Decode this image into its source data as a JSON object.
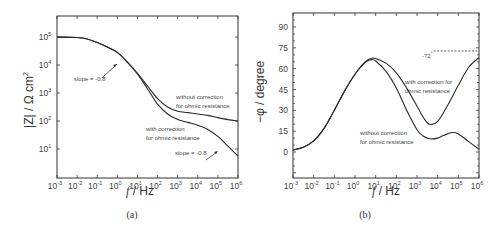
{
  "chart_data": [
    {
      "type": "line",
      "panel": "(a)",
      "title": "",
      "xlabel": "f / Hz",
      "ylabel": "|Z| / Ω cm²",
      "xscale": "log",
      "yscale": "log",
      "xlim": [
        0.001,
        1000000
      ],
      "ylim": [
        1,
        562341
      ],
      "x_ticks": [
        "10^-3",
        "10^-2",
        "10^-1",
        "10^0",
        "10^1",
        "10^2",
        "10^3",
        "10^4",
        "10^5",
        "10^6"
      ],
      "y_ticks": [
        "10^1",
        "10^2",
        "10^3",
        "10^4",
        "10^5"
      ],
      "grid": false,
      "series": [
        {
          "name": "without correction for ohmic resistance",
          "log_x": [
            -3,
            -2,
            -1.5,
            -1,
            -0.5,
            0,
            0.5,
            1,
            1.5,
            2,
            2.5,
            3,
            3.5,
            4,
            4.5,
            5,
            5.5,
            6
          ],
          "log_y": [
            5.0,
            4.98,
            4.93,
            4.8,
            4.64,
            4.45,
            4.1,
            3.7,
            3.25,
            2.8,
            2.5,
            2.35,
            2.3,
            2.25,
            2.2,
            2.12,
            2.05,
            2.0
          ]
        },
        {
          "name": "with correction for ohmic resistance",
          "log_x": [
            -3,
            -2,
            -1.5,
            -1,
            -0.5,
            0,
            0.5,
            1,
            1.5,
            2,
            2.5,
            3,
            3.5,
            4,
            4.5,
            5,
            5.5,
            6
          ],
          "log_y": [
            5.0,
            4.98,
            4.93,
            4.8,
            4.64,
            4.45,
            4.1,
            3.68,
            3.15,
            2.6,
            2.25,
            2.05,
            1.95,
            1.85,
            1.7,
            1.45,
            1.1,
            0.75
          ]
        }
      ],
      "annotations": [
        {
          "text": "slope = -0.8",
          "at_log_x": 0.3,
          "at_log_y": 4.3
        },
        {
          "text": "without correction",
          "line2": "for ohmic resistance"
        },
        {
          "text": "with correction",
          "line2": "for ohmic resistance"
        },
        {
          "text": "slope = -0.8",
          "at_log_x": 5.0,
          "at_log_y": 1.45
        }
      ]
    },
    {
      "type": "line",
      "panel": "(b)",
      "title": "",
      "xlabel": "f / Hz",
      "ylabel": "−φ / degree",
      "xscale": "log",
      "yscale": "linear",
      "xlim": [
        0.001,
        1000000
      ],
      "ylim": [
        -18,
        100
      ],
      "x_ticks": [
        "10^-3",
        "10^-2",
        "10^-1",
        "10^0",
        "10^1",
        "10^2",
        "10^3",
        "10^4",
        "10^5",
        "10^6"
      ],
      "y_ticks": [
        0,
        15,
        30,
        45,
        60,
        75,
        90
      ],
      "grid": false,
      "series": [
        {
          "name": "with correction for ohmic resistance",
          "log_x": [
            -3,
            -2.5,
            -2,
            -1.5,
            -1,
            -0.5,
            0,
            0.5,
            0.8,
            1,
            1.5,
            2,
            2.5,
            3,
            3.3,
            3.6,
            4,
            4.5,
            5,
            5.5,
            6
          ],
          "log_y_values_deg": [
            1.5,
            3.5,
            8,
            17,
            30,
            44,
            56,
            65,
            67.5,
            67.3,
            64,
            57,
            46,
            33,
            25,
            20,
            22,
            34,
            48,
            61,
            68
          ]
        },
        {
          "name": "without correction for ohmic resistance",
          "log_x": [
            -3,
            -2.5,
            -2,
            -1.5,
            -1,
            -0.5,
            0,
            0.5,
            0.8,
            1,
            1.5,
            2,
            2.5,
            3,
            3.3,
            3.6,
            4,
            4.3,
            4.7,
            5,
            5.5,
            6
          ],
          "log_y_values_deg": [
            1.5,
            3.5,
            8,
            17,
            30,
            44,
            56,
            64.5,
            66.5,
            65.5,
            58,
            46,
            30,
            16,
            11.5,
            9.5,
            10,
            12,
            14,
            13,
            7.5,
            2
          ]
        }
      ],
      "reference_line": {
        "value_deg": 72,
        "from_log_x": 3.8,
        "to_log_x": 6,
        "style": "dashed"
      },
      "annotations": [
        {
          "text": "-72°"
        },
        {
          "text": "with correction for",
          "line2": "ohmic resistance"
        },
        {
          "text": "without correction",
          "line2": "for ohmic resistance"
        }
      ]
    }
  ],
  "panels": {
    "a": {
      "caption": "(a)",
      "xlabel_italic": "f",
      "xlabel_rest": " / Hz",
      "ylabel": "|Z| / Ω cm",
      "ylabel_sup": "2",
      "annot_slope_1": "slope = -0.8",
      "annot_slope_2": "slope = -0.8",
      "annot_without_1": "without correction",
      "annot_without_2": "for ohmic resistance",
      "annot_with_1": "with correction",
      "annot_with_2": "for ohmic resistance"
    },
    "b": {
      "caption": "(b)",
      "xlabel_italic": "f",
      "xlabel_rest": " / Hz",
      "ylabel": "−φ / degree",
      "annot_72": "-72",
      "annot_72_sup": "°",
      "annot_with_1": "with correction for",
      "annot_with_2": "ohmic resistance",
      "annot_without_1": "without correction",
      "annot_without_2": "for ohmic resistance"
    }
  },
  "tick_base": "10",
  "x_exponents": [
    "-3",
    "-2",
    "-1",
    "0",
    "1",
    "2",
    "3",
    "4",
    "5",
    "6"
  ],
  "a_y_exponents": [
    "1",
    "2",
    "3",
    "4",
    "5"
  ],
  "b_y_labels": [
    "0",
    "15",
    "30",
    "45",
    "60",
    "75",
    "90"
  ]
}
